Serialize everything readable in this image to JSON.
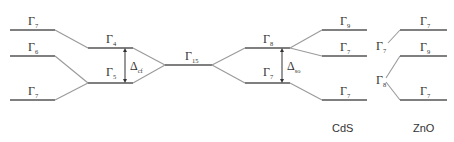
{
  "diagram": {
    "type": "energy-level splitting diagram",
    "colors": {
      "level": "#555555",
      "connector": "#9a9a9a",
      "text": "#333333"
    },
    "columns": [
      {
        "id": "left",
        "levels": [
          {
            "symbol": "Γ",
            "sub": "7",
            "y": 30
          },
          {
            "symbol": "Γ",
            "sub": "6",
            "y": 56
          },
          {
            "symbol": "Γ",
            "sub": "7",
            "y": 100
          }
        ]
      },
      {
        "id": "crystal-field",
        "levels": [
          {
            "symbol": "Γ",
            "sub": "4",
            "y": 48
          },
          {
            "symbol": "Γ",
            "sub": "5",
            "y": 83
          }
        ],
        "gap": {
          "symbol": "Δ",
          "sub": "cf"
        }
      },
      {
        "id": "center",
        "levels": [
          {
            "symbol": "Γ",
            "sub": "15",
            "y": 65
          }
        ]
      },
      {
        "id": "spin-orbit",
        "levels": [
          {
            "symbol": "Γ",
            "sub": "8",
            "y": 48
          },
          {
            "symbol": "Γ",
            "sub": "7",
            "y": 83
          }
        ],
        "gap": {
          "symbol": "Δ",
          "sub": "so"
        }
      },
      {
        "id": "cds",
        "title": "CdS",
        "levels": [
          {
            "symbol": "Γ",
            "sub": "9",
            "y": 30
          },
          {
            "symbol": "Γ",
            "sub": "7",
            "y": 56
          },
          {
            "symbol": "Γ",
            "sub": "7",
            "y": 100
          }
        ]
      },
      {
        "id": "zno",
        "title": "ZnO",
        "branch_labels": [
          {
            "symbol": "Γ",
            "sub": "7"
          },
          {
            "symbol": "Γ",
            "sub": "8"
          }
        ],
        "levels": [
          {
            "symbol": "Γ",
            "sub": "7",
            "y": 30
          },
          {
            "symbol": "Γ",
            "sub": "9",
            "y": 56
          },
          {
            "symbol": "Γ",
            "sub": "7",
            "y": 100
          }
        ]
      }
    ]
  }
}
